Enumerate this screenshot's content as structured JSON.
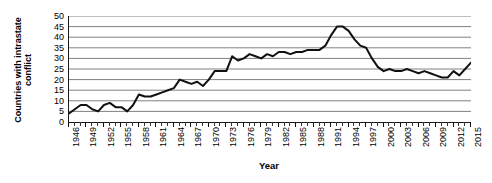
{
  "chart_data": {
    "type": "line",
    "title": "",
    "xlabel": "Year",
    "ylabel": "Countries with intrastate conflict",
    "ylabel_line1": "Countries with intrastate",
    "ylabel_line2": "conflict",
    "xlim": [
      1946,
      2015
    ],
    "ylim": [
      0,
      50
    ],
    "ytick_step": 5,
    "xtick_step": 3,
    "grid": true,
    "grid_axis": "y",
    "legend": false,
    "line_color": "#111111",
    "grid_color": "#808080",
    "axis_color": "#1a1a1a",
    "ytick_labels": [
      "0",
      "5",
      "10",
      "15",
      "20",
      "25",
      "30",
      "35",
      "40",
      "45",
      "50"
    ],
    "ytick_values": [
      0,
      5,
      10,
      15,
      20,
      25,
      30,
      35,
      40,
      45,
      50
    ],
    "xtick_labels": [
      "1946",
      "1949",
      "1952",
      "1955",
      "1958",
      "1961",
      "1964",
      "1967",
      "1970",
      "1973",
      "1976",
      "1979",
      "1982",
      "1985",
      "1988",
      "1991",
      "1994",
      "1997",
      "2000",
      "2003",
      "2006",
      "2009",
      "2012",
      "2015"
    ],
    "xtick_values": [
      1946,
      1949,
      1952,
      1955,
      1958,
      1961,
      1964,
      1967,
      1970,
      1973,
      1976,
      1979,
      1982,
      1985,
      1988,
      1991,
      1994,
      1997,
      2000,
      2003,
      2006,
      2009,
      2012,
      2015
    ],
    "x": [
      1946,
      1947,
      1948,
      1949,
      1950,
      1951,
      1952,
      1953,
      1954,
      1955,
      1956,
      1957,
      1958,
      1959,
      1960,
      1961,
      1962,
      1963,
      1964,
      1965,
      1966,
      1967,
      1968,
      1969,
      1970,
      1971,
      1972,
      1973,
      1974,
      1975,
      1976,
      1977,
      1978,
      1979,
      1980,
      1981,
      1982,
      1983,
      1984,
      1985,
      1986,
      1987,
      1988,
      1989,
      1990,
      1991,
      1992,
      1993,
      1994,
      1995,
      1996,
      1997,
      1998,
      1999,
      2000,
      2001,
      2002,
      2003,
      2004,
      2005,
      2006,
      2007,
      2008,
      2009,
      2010,
      2011,
      2012,
      2013,
      2014,
      2015
    ],
    "values": [
      4,
      6,
      8,
      8,
      6,
      5,
      8,
      9,
      7,
      7,
      5,
      8,
      13,
      12,
      12,
      13,
      14,
      15,
      16,
      20,
      19,
      18,
      19,
      17,
      20,
      24,
      24,
      24,
      31,
      29,
      30,
      32,
      31,
      30,
      32,
      31,
      33,
      33,
      32,
      33,
      33,
      34,
      34,
      34,
      36,
      41,
      45,
      45,
      43,
      39,
      36,
      35,
      30,
      26,
      24,
      25,
      24,
      24,
      25,
      24,
      23,
      24,
      23,
      22,
      21,
      21,
      24,
      22,
      25,
      28
    ],
    "series_name": "Countries with intrastate conflict"
  }
}
